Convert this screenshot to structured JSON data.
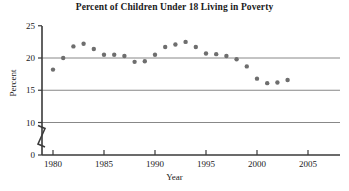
{
  "chart_data": {
    "type": "scatter",
    "title": "Percent of Children Under 18 Living in Poverty",
    "xlabel": "Year",
    "ylabel": "Percent",
    "x": [
      1980,
      1981,
      1982,
      1983,
      1984,
      1985,
      1986,
      1987,
      1988,
      1989,
      1990,
      1991,
      1992,
      1993,
      1994,
      1995,
      1996,
      1997,
      1998,
      1999,
      2000,
      2001,
      2002,
      2003
    ],
    "values": [
      18.2,
      20.0,
      21.8,
      22.2,
      21.4,
      20.5,
      20.5,
      20.3,
      19.4,
      19.5,
      20.5,
      21.7,
      22.1,
      22.5,
      21.7,
      20.7,
      20.6,
      20.3,
      19.8,
      18.7,
      16.8,
      16.1,
      16.2,
      16.6
    ],
    "series": [
      {
        "name": "Percent of children under 18 living in poverty",
        "values": [
          18.2,
          20.0,
          21.8,
          22.2,
          21.4,
          20.5,
          20.5,
          20.3,
          19.4,
          19.5,
          20.5,
          21.7,
          22.1,
          22.5,
          21.7,
          20.7,
          20.6,
          20.3,
          19.8,
          18.7,
          16.8,
          16.1,
          16.2,
          16.6
        ]
      }
    ],
    "xlim": [
      1978.5,
      2008.5
    ],
    "ylim": [
      0,
      25
    ],
    "y_ticks": [
      0,
      10,
      15,
      20,
      25
    ],
    "y_tick_labels": [
      "0",
      "10",
      "15",
      "20",
      "25"
    ],
    "x_ticks": [
      1980,
      1985,
      1990,
      1995,
      2000,
      2005
    ],
    "x_tick_labels": [
      "1980",
      "1985",
      "1990",
      "1995",
      "2000",
      "2005"
    ],
    "gridlines": [
      "horizontal at 10",
      "horizontal at 15",
      "horizontal at 20"
    ],
    "grid": true,
    "legend": "none",
    "axis_break": {
      "axis": "y",
      "between": [
        0,
        10
      ],
      "symbol": "zigzag"
    },
    "marker": {
      "shape": "circle",
      "color": "#6e6e6e",
      "radius": 2.2
    },
    "colors": {
      "marker": "#6e6e6e",
      "axis": "#3a3a3a",
      "gridline": "#7a7a7a",
      "text": "#1a1a1a",
      "background": "#ffffff"
    }
  }
}
